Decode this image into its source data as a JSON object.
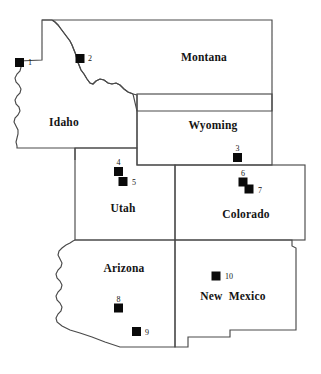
{
  "figure": {
    "background_color": "#ffffff",
    "border_color": "#4a4a4a",
    "marker_color": "#0a0a0a",
    "label_color": "#141414"
  },
  "states": [
    {
      "id": "montana",
      "name": "Montana",
      "label_x": 204,
      "label_y": 61
    },
    {
      "id": "idaho",
      "name": "Idaho",
      "label_x": 64,
      "label_y": 126
    },
    {
      "id": "wyoming",
      "name": "Wyoming",
      "label_x": 213,
      "label_y": 129
    },
    {
      "id": "utah",
      "name": "Utah",
      "label_x": 123,
      "label_y": 212
    },
    {
      "id": "colorado",
      "name": "Colorado",
      "label_x": 246,
      "label_y": 218
    },
    {
      "id": "arizona",
      "name": "Arizona",
      "label_x": 124,
      "label_y": 272
    },
    {
      "id": "new-mexico",
      "name": "New  Mexico",
      "label_x": 233,
      "label_y": 300
    }
  ],
  "sites": [
    {
      "id": 1,
      "label": "1",
      "marker_x": 19.5,
      "marker_y": 62.5,
      "label_x": 28,
      "label_y": 65,
      "label_pos": "right"
    },
    {
      "id": 2,
      "label": "2",
      "marker_x": 80.0,
      "marker_y": 58.5,
      "label_x": 88,
      "label_y": 61,
      "label_pos": "right"
    },
    {
      "id": 3,
      "label": "3",
      "marker_x": 237.5,
      "marker_y": 157.5,
      "label_x": 237.5,
      "label_y": 152.5,
      "label_pos": "above"
    },
    {
      "id": 4,
      "label": "4",
      "marker_x": 118.5,
      "marker_y": 171.5,
      "label_x": 118.5,
      "label_y": 166.5,
      "label_pos": "above"
    },
    {
      "id": 5,
      "label": "5",
      "marker_x": 123.0,
      "marker_y": 181.5,
      "label_x": 132,
      "label_y": 184,
      "label_pos": "right"
    },
    {
      "id": 6,
      "label": "6",
      "marker_x": 243.0,
      "marker_y": 182.0,
      "label_x": 243,
      "label_y": 176.5,
      "label_pos": "above"
    },
    {
      "id": 7,
      "label": "7",
      "marker_x": 249.0,
      "marker_y": 189.0,
      "label_x": 258,
      "label_y": 192,
      "label_pos": "right"
    },
    {
      "id": 8,
      "label": "8",
      "marker_x": 118.5,
      "marker_y": 308.0,
      "label_x": 118.5,
      "label_y": 302,
      "label_pos": "above"
    },
    {
      "id": 9,
      "label": "9",
      "marker_x": 136.5,
      "marker_y": 331.5,
      "label_x": 145,
      "label_y": 334,
      "label_pos": "right"
    },
    {
      "id": 10,
      "label": "10",
      "marker_x": 216.0,
      "marker_y": 276.0,
      "label_x": 225,
      "label_y": 279,
      "label_pos": "right"
    }
  ],
  "marker_size": 9
}
